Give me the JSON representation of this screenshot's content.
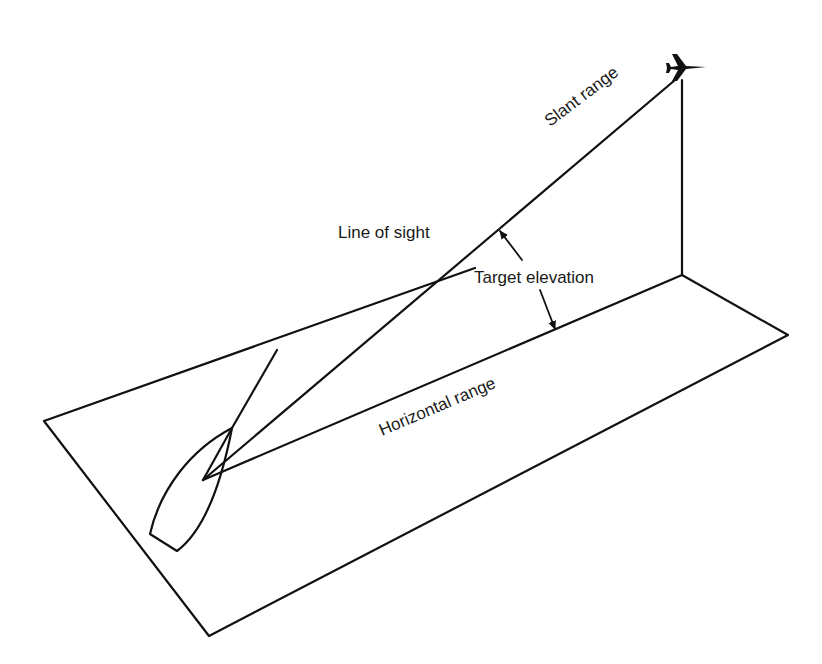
{
  "diagram": {
    "type": "geometry-illustration",
    "labels": {
      "slant_range": "Slant range",
      "line_of_sight": "Line of sight",
      "target_elevation": "Target elevation",
      "horizontal_range": "Horizontal range"
    },
    "elements": {
      "aircraft": "aircraft-icon",
      "ship": "ship-outline"
    },
    "colors": {
      "line": "#111111",
      "background": "#ffffff"
    }
  }
}
